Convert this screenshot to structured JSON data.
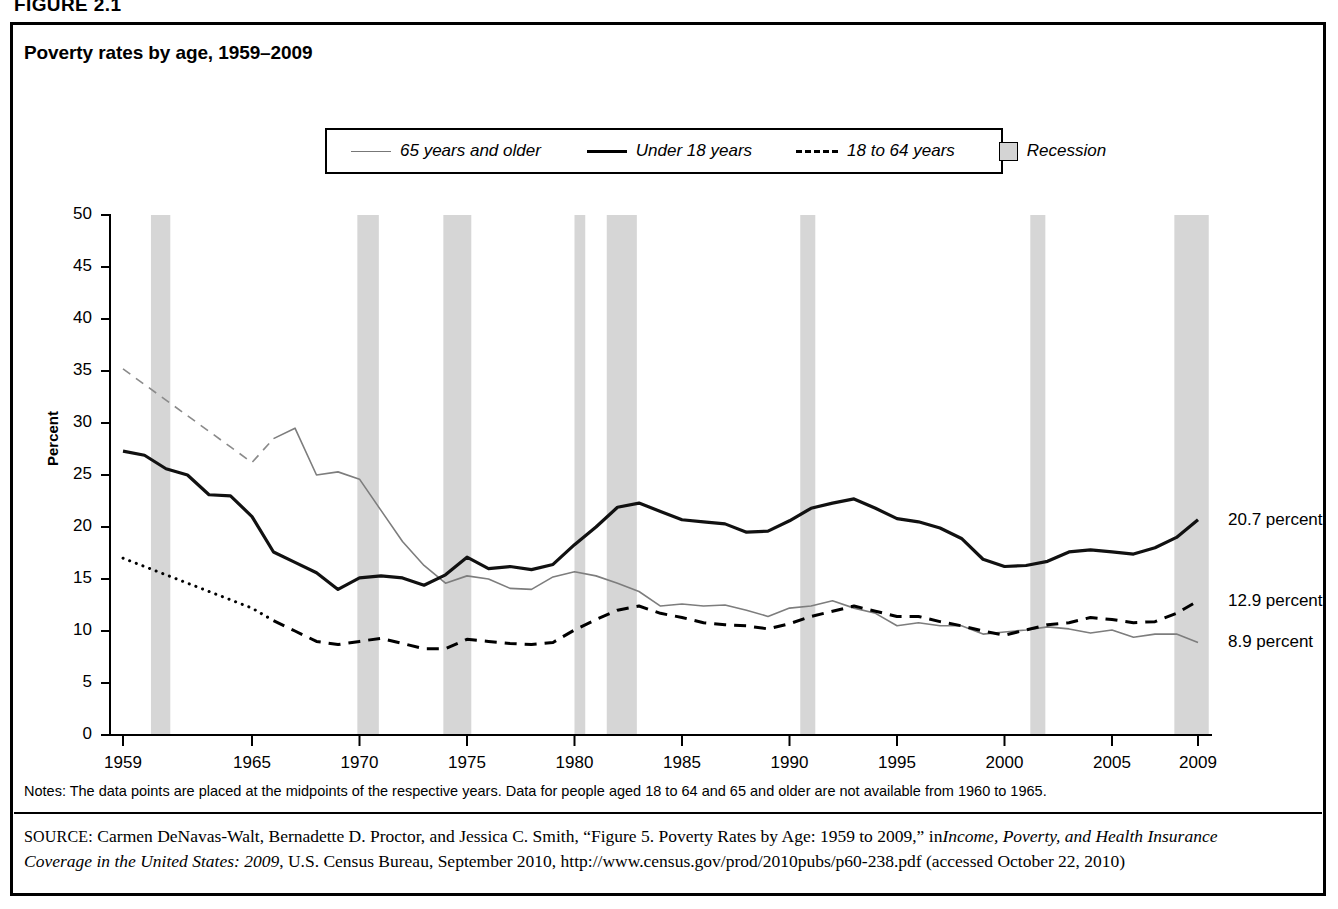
{
  "figure": {
    "number_label": "FIGURE 2.1",
    "title": "Poverty rates by age, 1959–2009"
  },
  "legend": {
    "items": [
      {
        "label": "65 years and older",
        "style": "thin-solid-gray",
        "color": "#777777"
      },
      {
        "label": "Under 18 years",
        "style": "thick-solid-black",
        "color": "#000000"
      },
      {
        "label": "18 to 64 years",
        "style": "dashed-black",
        "color": "#000000"
      },
      {
        "label": "Recession",
        "style": "filled-box",
        "color": "#d4d4d4"
      }
    ]
  },
  "axes": {
    "y_title": "Percent",
    "y_ticks": [
      "0",
      "5",
      "10",
      "15",
      "20",
      "25",
      "30",
      "35",
      "40",
      "45",
      "50"
    ],
    "x_ticks": [
      "1959",
      "1965",
      "1970",
      "1975",
      "1980",
      "1985",
      "1990",
      "1995",
      "2000",
      "2005",
      "2009"
    ]
  },
  "end_labels": [
    {
      "text": "20.7 percent",
      "series": "Under 18 years",
      "value": 20.7
    },
    {
      "text": "12.9 percent",
      "series": "18 to 64 years",
      "value": 12.9
    },
    {
      "text": "8.9 percent",
      "series": "65 years and older",
      "value": 8.9
    }
  ],
  "notes": "Notes: The data points are placed at the midpoints of the respective years. Data for people aged 18 to 64 and 65 and older are not available from 1960 to 1965.",
  "source": {
    "prefix": "SOURCE:",
    "body_1": " Carmen DeNavas-Walt, Bernadette D. Proctor, and Jessica C. Smith, “Figure 5. Poverty Rates by Age: 1959 to 2009,” in",
    "italic_1": "Income, Poverty, and Health Insurance Coverage in the United States: 2009",
    "body_2": ", U.S. Census Bureau, September 2010, http://www.census.gov/prod/2010pubs/p60-238.pdf (accessed October 22, 2010)"
  },
  "chart_data": {
    "type": "line",
    "title": "Poverty rates by age, 1959–2009",
    "xlabel": "",
    "ylabel": "Percent",
    "xlim": [
      1959,
      2009
    ],
    "ylim": [
      0,
      50
    ],
    "grid": false,
    "legend_position": "top-center",
    "x": [
      1959,
      1960,
      1961,
      1962,
      1963,
      1964,
      1965,
      1966,
      1967,
      1968,
      1969,
      1970,
      1971,
      1972,
      1973,
      1974,
      1975,
      1976,
      1977,
      1978,
      1979,
      1980,
      1981,
      1982,
      1983,
      1984,
      1985,
      1986,
      1987,
      1988,
      1989,
      1990,
      1991,
      1992,
      1993,
      1994,
      1995,
      1996,
      1997,
      1998,
      1999,
      2000,
      2001,
      2002,
      2003,
      2004,
      2005,
      2006,
      2007,
      2008,
      2009
    ],
    "series": [
      {
        "name": "Under 18 years",
        "style": "thick-solid-black",
        "values": [
          27.3,
          26.9,
          25.6,
          25.0,
          23.1,
          23.0,
          21.0,
          17.6,
          16.6,
          15.6,
          14.0,
          15.1,
          15.3,
          15.1,
          14.4,
          15.4,
          17.1,
          16.0,
          16.2,
          15.9,
          16.4,
          18.3,
          20.0,
          21.9,
          22.3,
          21.5,
          20.7,
          20.5,
          20.3,
          19.5,
          19.6,
          20.6,
          21.8,
          22.3,
          22.7,
          21.8,
          20.8,
          20.5,
          19.9,
          18.9,
          16.9,
          16.2,
          16.3,
          16.7,
          17.6,
          17.8,
          17.6,
          17.4,
          18.0,
          19.0,
          20.7
        ]
      },
      {
        "name": "18 to 64 years",
        "style": "dashed-black",
        "values": [
          17.0,
          16.2,
          15.4,
          14.6,
          13.8,
          13.0,
          12.2,
          11.0,
          10.0,
          9.0,
          8.7,
          9.0,
          9.3,
          8.8,
          8.3,
          8.3,
          9.2,
          9.0,
          8.8,
          8.7,
          8.9,
          10.1,
          11.1,
          12.0,
          12.4,
          11.7,
          11.3,
          10.8,
          10.6,
          10.5,
          10.2,
          10.7,
          11.4,
          11.9,
          12.4,
          11.9,
          11.4,
          11.4,
          10.9,
          10.5,
          10.0,
          9.6,
          10.1,
          10.6,
          10.8,
          11.3,
          11.1,
          10.8,
          10.9,
          11.7,
          12.9
        ]
      },
      {
        "name": "65 years and older",
        "style": "thin-solid-gray",
        "values": [
          35.2,
          33.7,
          32.2,
          30.7,
          29.2,
          27.7,
          26.2,
          28.5,
          29.5,
          25.0,
          25.3,
          24.6,
          21.6,
          18.6,
          16.3,
          14.6,
          15.3,
          15.0,
          14.1,
          14.0,
          15.2,
          15.7,
          15.3,
          14.6,
          13.8,
          12.4,
          12.6,
          12.4,
          12.5,
          12.0,
          11.4,
          12.2,
          12.4,
          12.9,
          12.2,
          11.7,
          10.5,
          10.8,
          10.5,
          10.5,
          9.7,
          9.9,
          10.1,
          10.4,
          10.2,
          9.8,
          10.1,
          9.4,
          9.7,
          9.7,
          8.9
        ]
      }
    ],
    "recessions": [
      {
        "start": 1960.3,
        "end": 1961.2
      },
      {
        "start": 1969.9,
        "end": 1970.9
      },
      {
        "start": 1973.9,
        "end": 1975.2
      },
      {
        "start": 1980.0,
        "end": 1980.5
      },
      {
        "start": 1981.5,
        "end": 1982.9
      },
      {
        "start": 1990.5,
        "end": 1991.2
      },
      {
        "start": 2001.2,
        "end": 2001.9
      },
      {
        "start": 2007.9,
        "end": 2009.5
      }
    ]
  }
}
